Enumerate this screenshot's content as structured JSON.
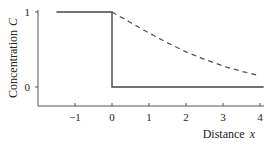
{
  "chart_data": {
    "type": "line",
    "title": "",
    "xlabel": "Distance",
    "xlabel_symbol": "x",
    "ylabel": "Concentration",
    "ylabel_symbol": "C",
    "xlim": [
      -1.5,
      4.1
    ],
    "ylim": [
      -0.25,
      1.0
    ],
    "xticks": [
      -1,
      0,
      1,
      2,
      3,
      4
    ],
    "yticks": [
      0,
      1
    ],
    "grid": false,
    "legend": null,
    "series": [
      {
        "name": "initial step profile",
        "style": "solid",
        "x": [
          -1.5,
          0,
          0,
          4.1
        ],
        "y": [
          1,
          1,
          0,
          0
        ]
      },
      {
        "name": "diffused profile",
        "style": "dashed",
        "x": [
          0,
          0.5,
          1,
          1.5,
          2,
          2.5,
          3,
          3.5,
          4
        ],
        "y": [
          1.0,
          0.86,
          0.72,
          0.59,
          0.47,
          0.37,
          0.28,
          0.21,
          0.15
        ]
      }
    ]
  }
}
